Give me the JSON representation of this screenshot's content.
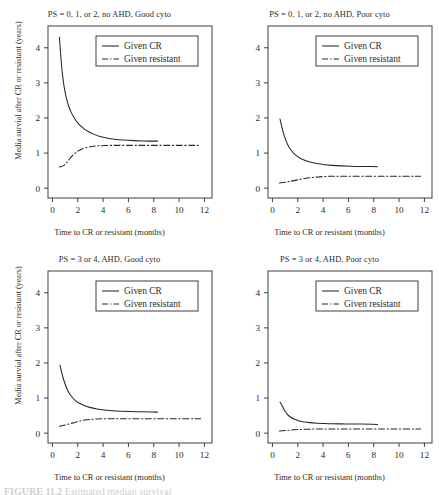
{
  "figure": {
    "caption_label": "FIGURE 11.2",
    "caption_text": "Estimated median survival"
  },
  "axes": {
    "xlabel": "Time to CR or resistant (months)",
    "ylabel": "Media survial after CR or resistant (years)",
    "xticks": [
      0,
      2,
      4,
      6,
      8,
      10,
      12
    ],
    "yticks": [
      0,
      1,
      2,
      3,
      4
    ],
    "xlim": [
      -0.35,
      12.6
    ],
    "ylim": [
      -0.28,
      4.62
    ],
    "grid": false
  },
  "legend": {
    "position": "top-center",
    "entries": [
      {
        "label": "Given CR",
        "style": "solid"
      },
      {
        "label": "Given resistant",
        "style": "dashdot"
      }
    ]
  },
  "chart_data": [
    {
      "type": "line",
      "title": "PS = 0, 1, or 2, no AHD, Good cyto",
      "xlabel": "Time to CR or resistant (months)",
      "ylabel": "Media survial after CR or resistant (years)",
      "xlim": [
        -0.35,
        12.6
      ],
      "ylim": [
        -0.28,
        4.62
      ],
      "xticks": [
        0,
        2,
        4,
        6,
        8,
        10,
        12
      ],
      "yticks": [
        0,
        1,
        2,
        3,
        4
      ],
      "series": [
        {
          "name": "Given CR",
          "style": "solid",
          "x": [
            0.55,
            0.7,
            0.85,
            1.0,
            1.2,
            1.4,
            1.6,
            1.9,
            2.2,
            2.6,
            3.0,
            3.5,
            4.0,
            4.6,
            5.2,
            6.0,
            6.8,
            7.6,
            8.3
          ],
          "y": [
            4.3,
            3.55,
            3.05,
            2.72,
            2.42,
            2.22,
            2.07,
            1.9,
            1.78,
            1.66,
            1.58,
            1.5,
            1.45,
            1.41,
            1.38,
            1.36,
            1.35,
            1.34,
            1.34
          ]
        },
        {
          "name": "Given resistant",
          "style": "dashdot",
          "x": [
            0.55,
            0.8,
            1.0,
            1.2,
            1.5,
            1.8,
            2.1,
            2.5,
            2.9,
            3.3,
            3.8,
            4.4,
            5.0,
            6.0,
            7.0,
            8.0,
            9.0,
            10.0,
            11.0,
            11.7
          ],
          "y": [
            0.6,
            0.62,
            0.68,
            0.76,
            0.9,
            1.0,
            1.08,
            1.14,
            1.18,
            1.2,
            1.21,
            1.22,
            1.22,
            1.22,
            1.22,
            1.22,
            1.22,
            1.22,
            1.22,
            1.22
          ]
        }
      ]
    },
    {
      "type": "line",
      "title": "PS = 0, 1, or 2, no AHD, Poor cyto",
      "xlabel": "Time to CR or resistant (months)",
      "ylabel": "Media survial after CR or resistant (years)",
      "xlim": [
        -0.35,
        12.6
      ],
      "ylim": [
        -0.28,
        4.62
      ],
      "xticks": [
        0,
        2,
        4,
        6,
        8,
        10,
        12
      ],
      "yticks": [
        0,
        1,
        2,
        3,
        4
      ],
      "series": [
        {
          "name": "Given CR",
          "style": "solid",
          "x": [
            0.6,
            0.75,
            0.9,
            1.1,
            1.3,
            1.6,
            1.9,
            2.3,
            2.7,
            3.2,
            3.8,
            4.4,
            5.0,
            5.8,
            6.6,
            7.4,
            8.3
          ],
          "y": [
            1.97,
            1.73,
            1.52,
            1.32,
            1.17,
            1.02,
            0.92,
            0.83,
            0.77,
            0.72,
            0.68,
            0.66,
            0.64,
            0.63,
            0.62,
            0.62,
            0.61
          ]
        },
        {
          "name": "Given resistant",
          "style": "dashdot",
          "x": [
            0.55,
            0.9,
            1.2,
            1.5,
            1.9,
            2.3,
            2.8,
            3.3,
            3.9,
            4.5,
            5.2,
            6.0,
            7.0,
            8.0,
            9.0,
            10.0,
            11.0,
            11.7
          ],
          "y": [
            0.15,
            0.16,
            0.18,
            0.2,
            0.23,
            0.26,
            0.29,
            0.31,
            0.33,
            0.34,
            0.34,
            0.34,
            0.34,
            0.34,
            0.34,
            0.34,
            0.34,
            0.34
          ]
        }
      ]
    },
    {
      "type": "line",
      "title": "PS = 3 or 4, AHD, Good cyto",
      "xlabel": "Time to CR or resistant (months)",
      "ylabel": "Media survial after CR or resistant (years)",
      "xlim": [
        -0.35,
        12.6
      ],
      "ylim": [
        -0.28,
        4.62
      ],
      "xticks": [
        0,
        2,
        4,
        6,
        8,
        10,
        12
      ],
      "yticks": [
        0,
        1,
        2,
        3,
        4
      ],
      "series": [
        {
          "name": "Given CR",
          "style": "solid",
          "x": [
            0.6,
            0.75,
            0.9,
            1.1,
            1.3,
            1.6,
            1.9,
            2.3,
            2.7,
            3.2,
            3.8,
            4.4,
            5.0,
            5.8,
            6.6,
            7.4,
            8.3
          ],
          "y": [
            1.94,
            1.7,
            1.5,
            1.3,
            1.15,
            1.0,
            0.9,
            0.82,
            0.76,
            0.71,
            0.67,
            0.65,
            0.63,
            0.62,
            0.61,
            0.61,
            0.6
          ]
        },
        {
          "name": "Given resistant",
          "style": "dashdot",
          "x": [
            0.55,
            0.9,
            1.2,
            1.5,
            1.9,
            2.3,
            2.8,
            3.3,
            3.9,
            4.5,
            5.2,
            6.0,
            7.0,
            8.0,
            9.0,
            10.0,
            11.0,
            11.7
          ],
          "y": [
            0.2,
            0.22,
            0.25,
            0.28,
            0.32,
            0.36,
            0.39,
            0.4,
            0.41,
            0.41,
            0.41,
            0.41,
            0.41,
            0.41,
            0.41,
            0.41,
            0.41,
            0.41
          ]
        }
      ]
    },
    {
      "type": "line",
      "title": "PS = 3 or 4, AHD, Poor cyto",
      "xlabel": "Time to CR or resistant (months)",
      "ylabel": "Media survial after CR or resistant (years)",
      "xlim": [
        -0.35,
        12.6
      ],
      "ylim": [
        -0.28,
        4.62
      ],
      "xticks": [
        0,
        2,
        4,
        6,
        8,
        10,
        12
      ],
      "yticks": [
        0,
        1,
        2,
        3,
        4
      ],
      "series": [
        {
          "name": "Given CR",
          "style": "solid",
          "x": [
            0.6,
            0.75,
            0.9,
            1.1,
            1.3,
            1.6,
            1.9,
            2.3,
            2.7,
            3.2,
            3.8,
            4.4,
            5.0,
            5.8,
            6.6,
            7.4,
            8.3
          ],
          "y": [
            0.88,
            0.8,
            0.68,
            0.57,
            0.49,
            0.42,
            0.37,
            0.33,
            0.31,
            0.29,
            0.28,
            0.27,
            0.27,
            0.26,
            0.26,
            0.26,
            0.25
          ]
        },
        {
          "name": "Given resistant",
          "style": "dashdot",
          "x": [
            0.55,
            0.9,
            1.2,
            1.5,
            1.9,
            2.3,
            2.8,
            3.3,
            3.9,
            4.5,
            5.2,
            6.0,
            7.0,
            8.0,
            9.0,
            10.0,
            11.0,
            11.7
          ],
          "y": [
            0.06,
            0.07,
            0.08,
            0.09,
            0.1,
            0.11,
            0.11,
            0.12,
            0.12,
            0.12,
            0.12,
            0.12,
            0.12,
            0.12,
            0.12,
            0.12,
            0.12,
            0.12
          ]
        }
      ]
    }
  ],
  "colors": {
    "line": "#262626",
    "frame": "#2b2b2b",
    "text": "#2b2b2b",
    "background": "#ffffff"
  }
}
